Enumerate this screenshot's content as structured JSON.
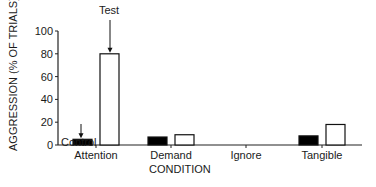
{
  "chart_data": {
    "type": "bar",
    "title": "",
    "xlabel": "CONDITION",
    "ylabel": "AGGRESSION (% OF TRIALS)",
    "ylim": [
      0,
      100
    ],
    "yticks": [
      0,
      20,
      40,
      60,
      80,
      100
    ],
    "categories": [
      "Attention",
      "Demand",
      "Ignore",
      "Tangible"
    ],
    "series": [
      {
        "name": "Control",
        "color": "#000000",
        "values": [
          5,
          7,
          0,
          8
        ]
      },
      {
        "name": "Test",
        "color": "#ffffff",
        "values": [
          80,
          9,
          0,
          18
        ]
      }
    ],
    "annotations": [
      {
        "text": "Control",
        "target": "Attention control bar",
        "arrow": true
      },
      {
        "text": "Test",
        "target": "Attention test bar",
        "arrow": true
      }
    ],
    "grid": false,
    "legend": "none (annotated with arrows)"
  }
}
